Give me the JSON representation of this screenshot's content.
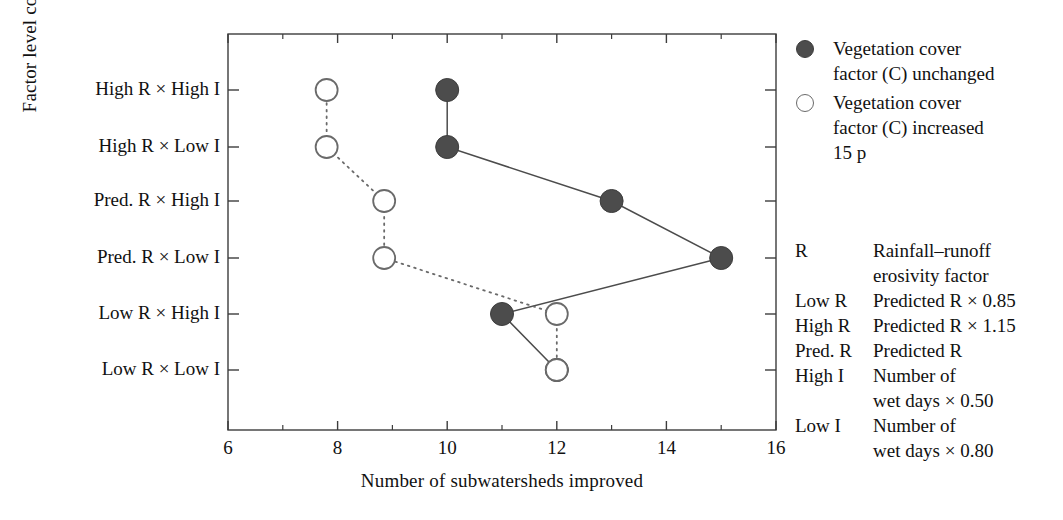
{
  "chart_data": {
    "type": "line",
    "title": "",
    "xlabel": "Number of subwatersheds improved",
    "ylabel": "Factor level combination",
    "xlim": [
      6,
      16
    ],
    "xticks": [
      6,
      8,
      10,
      12,
      14,
      16
    ],
    "xtick_labels": [
      "6",
      "8",
      "10",
      "12",
      "14",
      "16"
    ],
    "minor_xticks": [
      7,
      9,
      11,
      13,
      15
    ],
    "grid": false,
    "legend_position": "right",
    "categories": [
      "High R × High I",
      "High R × Low I",
      "Pred. R × High I",
      "Pred. R × Low I",
      "Low R × High I",
      "Low R × Low I"
    ],
    "series": [
      {
        "name": "Vegetation cover factor (C) unchanged",
        "marker": "filled-circle",
        "linestyle": "solid",
        "color": "#4c4c4c",
        "values": [
          10,
          10,
          13,
          15,
          11,
          12
        ]
      },
      {
        "name": "Vegetation cover factor (C) increased 15 p",
        "marker": "open-circle",
        "linestyle": "dotted",
        "color": "#6a6a6a",
        "values": [
          7.8,
          7.8,
          8.85,
          8.85,
          12,
          12
        ]
      }
    ]
  },
  "legend": {
    "items": [
      {
        "marker": "filled-circle",
        "label": "Vegetation cover\nfactor (C) unchanged"
      },
      {
        "marker": "open-circle",
        "label": "Vegetation cover\nfactor (C) increased\n15 p"
      }
    ]
  },
  "notes": {
    "rows": [
      {
        "key": "R",
        "value": "Rainfall–runoff\n  erosivity factor"
      },
      {
        "key": "Low R",
        "value": "Predicted R × 0.85"
      },
      {
        "key": "High R",
        "value": "Predicted R × 1.15"
      },
      {
        "key": "Pred. R",
        "value": "Predicted R"
      },
      {
        "key": "High I",
        "value": "Number of\nwet days × 0.50"
      },
      {
        "key": "Low I",
        "value": "Number of\nwet days × 0.80"
      }
    ]
  },
  "colors": {
    "axis": "#3d3d3d",
    "filled_marker": "#4c4c4c",
    "open_marker": "#6a6a6a",
    "text": "#111111",
    "background": "#ffffff"
  }
}
